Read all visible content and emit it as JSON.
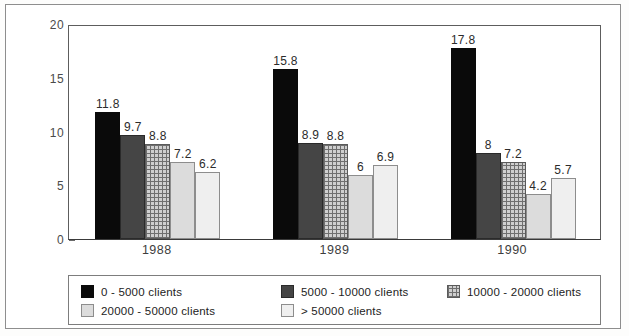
{
  "chart_data": {
    "type": "bar",
    "title": "",
    "subtitle": "",
    "xlabel": "",
    "ylabel": "",
    "categories": [
      "1988",
      "1989",
      "1990"
    ],
    "ylim": [
      0,
      20
    ],
    "ytick_labels": [
      "0",
      "5",
      "10",
      "15",
      "20"
    ],
    "ytick_values": [
      0,
      5,
      10,
      15,
      20
    ],
    "yminor_tick_values": [
      2.5,
      7.5,
      12.5,
      17.5
    ],
    "grid": false,
    "legend_position": "bottom",
    "grouped": true,
    "series": [
      {
        "name": "0 - 5000 clients",
        "fill": "solid-black",
        "color": "#0a0a0a",
        "values": [
          11.8,
          15.8,
          17.8
        ],
        "labels": [
          "11.8",
          "15.8",
          "17.8"
        ]
      },
      {
        "name": "5000 - 10000 clients",
        "fill": "dark-gray",
        "color": "#454545",
        "values": [
          9.7,
          8.9,
          8
        ],
        "labels": [
          "9.7",
          "8.9",
          "8"
        ]
      },
      {
        "name": "10000 - 20000 clients",
        "fill": "crosshatch",
        "color": "#6f6f6f",
        "values": [
          8.8,
          8.8,
          7.2
        ],
        "labels": [
          "8.8",
          "8.8",
          "7.2"
        ]
      },
      {
        "name": "20000 - 50000 clients",
        "fill": "light-gray",
        "color": "#dcdcdc",
        "values": [
          7.2,
          6,
          4.2
        ],
        "labels": [
          "7.2",
          "6",
          "4.2"
        ]
      },
      {
        "name": "> 50000 clients",
        "fill": "pale-gray",
        "color": "#efefef",
        "values": [
          6.2,
          6.9,
          5.7
        ],
        "labels": [
          "6.2",
          "6.9",
          "5.7"
        ]
      }
    ]
  },
  "legend": {
    "entries": [
      {
        "label": "0 - 5000 clients",
        "fill": "solid-black"
      },
      {
        "label": "5000 - 10000 clients",
        "fill": "dark-gray"
      },
      {
        "label": "10000 - 20000 clients",
        "fill": "crosshatch"
      },
      {
        "label": "20000 - 50000 clients",
        "fill": "light-gray"
      },
      {
        "label": "> 50000 clients",
        "fill": "pale-gray"
      }
    ],
    "order": [
      0,
      1,
      2,
      3,
      4
    ]
  }
}
